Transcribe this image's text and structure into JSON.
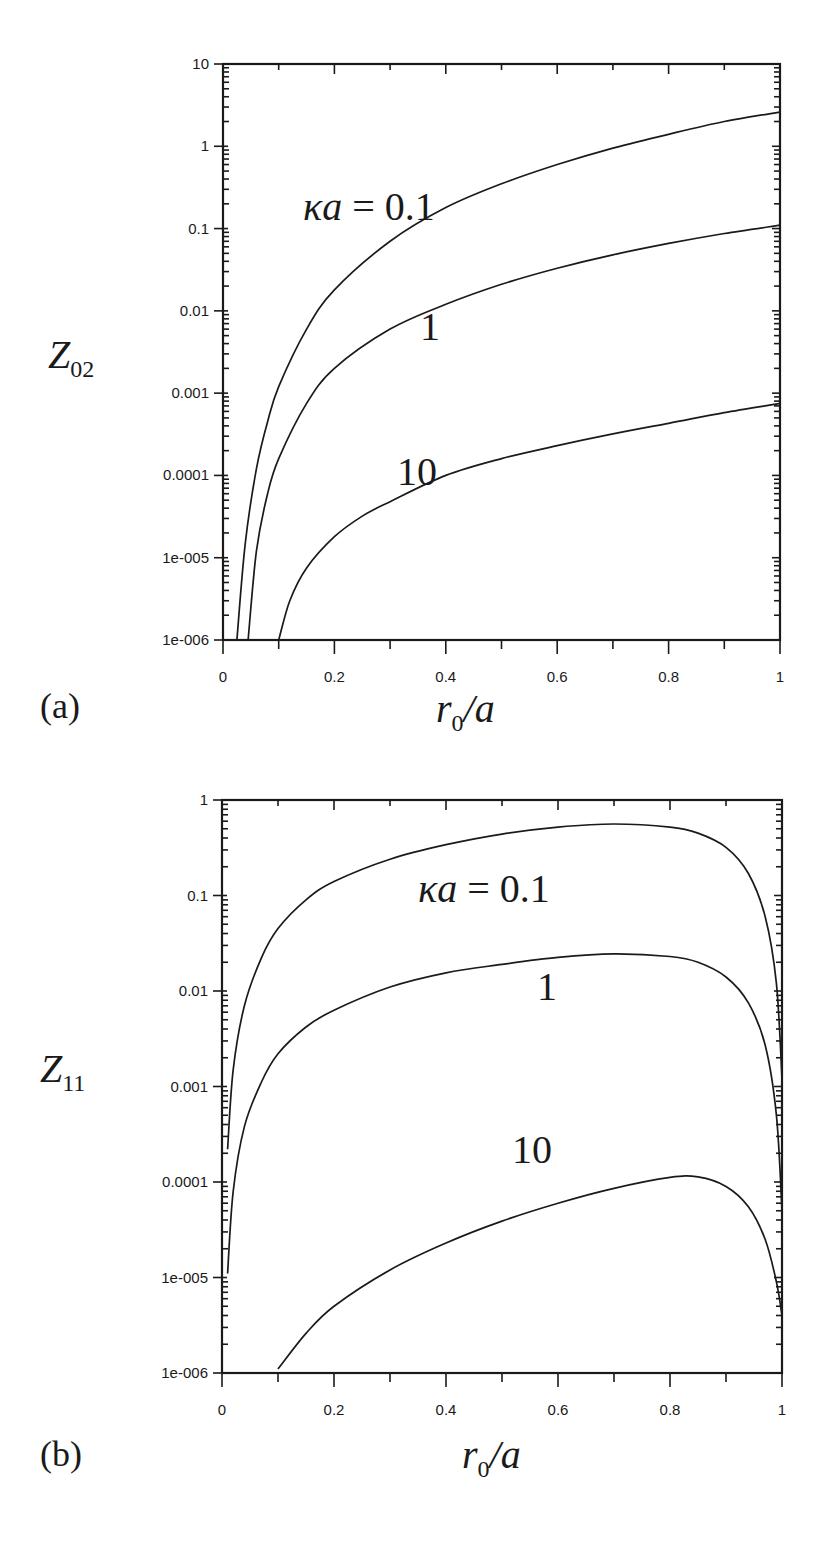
{
  "figure": {
    "panels": [
      "(a)",
      "(b)"
    ]
  },
  "chart_data": [
    {
      "type": "line",
      "panel_label": "(a)",
      "title": "",
      "xlabel": "r0/a",
      "ylabel": "Z02",
      "ylabel_main": "Z",
      "ylabel_sub": "02",
      "xlabel_main": "r",
      "xlabel_sub": "0",
      "xlabel_tail": "/a",
      "xscale": "linear",
      "yscale": "log",
      "xlim": [
        0,
        1
      ],
      "ylim": [
        1e-06,
        10
      ],
      "grid": false,
      "legend": "inline labels",
      "x_ticks": [
        "0",
        "0.2",
        "0.4",
        "0.6",
        "0.8",
        "1"
      ],
      "y_ticks": [
        "10",
        "1",
        "0.1",
        "0.01",
        "0.001",
        "0.0001",
        "1e-005",
        "1e-006"
      ],
      "annotations": [
        {
          "text_main": "κa",
          "text_rest": " = 0.1",
          "series": "κa=0.1"
        },
        {
          "text_main": "",
          "text_rest": "1",
          "series": "κa=1"
        },
        {
          "text_main": "",
          "text_rest": "10",
          "series": "κa=10"
        }
      ],
      "series": [
        {
          "name": "κa=0.1",
          "x": [
            0.025,
            0.04,
            0.06,
            0.08,
            0.1,
            0.15,
            0.2,
            0.3,
            0.4,
            0.5,
            0.6,
            0.7,
            0.8,
            0.9,
            1.0
          ],
          "y": [
            1e-06,
            1.5e-05,
            0.00012,
            0.00045,
            0.0012,
            0.006,
            0.018,
            0.07,
            0.18,
            0.35,
            0.6,
            0.95,
            1.4,
            2.0,
            2.6
          ]
        },
        {
          "name": "κa=1",
          "x": [
            0.045,
            0.06,
            0.08,
            0.1,
            0.15,
            0.2,
            0.3,
            0.4,
            0.5,
            0.6,
            0.7,
            0.8,
            0.9,
            1.0
          ],
          "y": [
            1e-06,
            1.2e-05,
            6e-05,
            0.00016,
            0.00075,
            0.002,
            0.006,
            0.012,
            0.021,
            0.033,
            0.048,
            0.066,
            0.087,
            0.11
          ]
        },
        {
          "name": "κa=10",
          "x": [
            0.1,
            0.12,
            0.15,
            0.2,
            0.25,
            0.3,
            0.4,
            0.5,
            0.6,
            0.7,
            0.8,
            0.9,
            1.0
          ],
          "y": [
            1e-06,
            3e-06,
            7.5e-06,
            1.8e-05,
            3.2e-05,
            4.8e-05,
            0.0001,
            0.00016,
            0.00023,
            0.00032,
            0.00043,
            0.00058,
            0.00075
          ]
        }
      ]
    },
    {
      "type": "line",
      "panel_label": "(b)",
      "title": "",
      "xlabel": "r0/a",
      "ylabel": "Z11",
      "ylabel_main": "Z",
      "ylabel_sub": "11",
      "xlabel_main": "r",
      "xlabel_sub": "0",
      "xlabel_tail": "/a",
      "xscale": "linear",
      "yscale": "log",
      "xlim": [
        0,
        1
      ],
      "ylim": [
        1e-06,
        1
      ],
      "grid": false,
      "legend": "inline labels",
      "x_ticks": [
        "0",
        "0.2",
        "0.4",
        "0.6",
        "0.8",
        "1"
      ],
      "y_ticks": [
        "1",
        "0.1",
        "0.01",
        "0.001",
        "0.0001",
        "1e-005",
        "1e-006"
      ],
      "annotations": [
        {
          "text_main": "κa",
          "text_rest": " = 0.1",
          "series": "κa=0.1"
        },
        {
          "text_main": "",
          "text_rest": "1",
          "series": "κa=1"
        },
        {
          "text_main": "",
          "text_rest": "10",
          "series": "κa=10"
        }
      ],
      "series": [
        {
          "name": "κa=0.1",
          "x": [
            0.01,
            0.02,
            0.04,
            0.07,
            0.1,
            0.15,
            0.2,
            0.3,
            0.4,
            0.5,
            0.6,
            0.7,
            0.8,
            0.85,
            0.9,
            0.94,
            0.97,
            0.99,
            1.0
          ],
          "y": [
            0.00022,
            0.0015,
            0.007,
            0.022,
            0.045,
            0.09,
            0.14,
            0.24,
            0.34,
            0.44,
            0.52,
            0.56,
            0.52,
            0.45,
            0.32,
            0.17,
            0.06,
            0.012,
            0.0012
          ]
        },
        {
          "name": "κa=1",
          "x": [
            0.01,
            0.02,
            0.04,
            0.07,
            0.1,
            0.15,
            0.2,
            0.3,
            0.4,
            0.5,
            0.6,
            0.7,
            0.8,
            0.85,
            0.9,
            0.94,
            0.97,
            0.99,
            1.0
          ],
          "y": [
            1.1e-05,
            8e-05,
            0.00038,
            0.0011,
            0.0022,
            0.0042,
            0.0063,
            0.011,
            0.0155,
            0.019,
            0.0225,
            0.0245,
            0.023,
            0.02,
            0.014,
            0.0075,
            0.0027,
            0.0005,
            5e-05
          ]
        },
        {
          "name": "κa=10",
          "x": [
            0.1,
            0.15,
            0.2,
            0.3,
            0.4,
            0.5,
            0.6,
            0.7,
            0.8,
            0.85,
            0.9,
            0.94,
            0.97,
            0.99,
            1.0
          ],
          "y": [
            1.1e-06,
            2.6e-06,
            5e-06,
            1.2e-05,
            2.3e-05,
            3.9e-05,
            6e-05,
            8.6e-05,
            0.000112,
            0.000113,
            9e-05,
            5.5e-05,
            2.5e-05,
            9e-06,
            4e-06
          ]
        }
      ]
    }
  ]
}
